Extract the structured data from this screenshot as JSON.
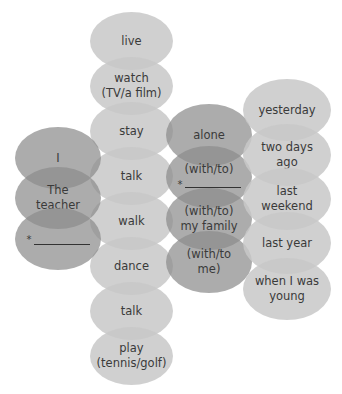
{
  "diagram": {
    "type": "sentence-builder-ovals",
    "subjects": [
      {
        "label": "I"
      },
      {
        "label": "The\nteacher"
      },
      {
        "label": "",
        "placeholder_mark": "*",
        "blank": true
      }
    ],
    "verbs": [
      {
        "label": "live"
      },
      {
        "label": "watch\n(TV/a film)"
      },
      {
        "label": "stay"
      },
      {
        "label": "talk"
      },
      {
        "label": "walk"
      },
      {
        "label": "dance"
      },
      {
        "label": "talk"
      },
      {
        "label": "play\n(tennis/golf)"
      }
    ],
    "companions": [
      {
        "label": "alone"
      },
      {
        "label": "(with/to)",
        "placeholder_mark": "*",
        "blank": true
      },
      {
        "label": "(with/to)\nmy family"
      },
      {
        "label": "(with/to\nme)"
      }
    ],
    "times": [
      {
        "label": "yesterday"
      },
      {
        "label": "two days\nago"
      },
      {
        "label": "last\nweekend"
      },
      {
        "label": "last year"
      },
      {
        "label": "when I was\nyoung"
      }
    ],
    "colors": {
      "light_oval": "#c8c8c8",
      "dark_oval": "#8c8c8c",
      "text": "#3a3a3a"
    }
  }
}
